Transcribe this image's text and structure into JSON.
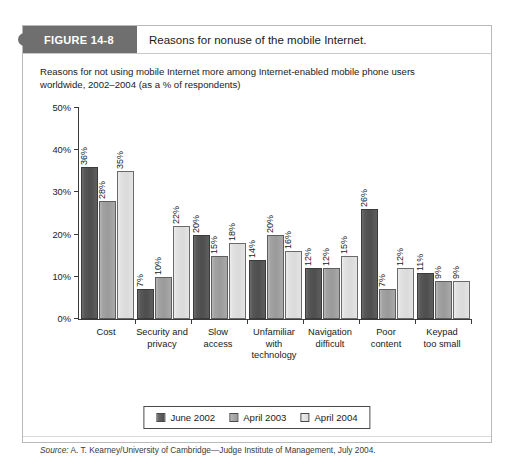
{
  "figure": {
    "tab_label": "FIGURE 14-8",
    "caption": "Reasons for nonuse of the mobile Internet."
  },
  "source": {
    "label": "Source:",
    "text": " A. T. Kearney/University of Cambridge—Judge Institute of Management, July 2004."
  },
  "colors": {
    "series_june_2002": "#4e4e4e",
    "series_april_2003": "#9a9a9a",
    "series_april_2004": "#dadada",
    "tab_background": "#6f6f6f",
    "axis": "#3a3a3a"
  },
  "chart_data": {
    "type": "bar",
    "title": "Reasons for not using mobile Internet more among Internet-enabled mobile phone users worldwide, 2002–2004 (as a % of respondents)",
    "title_line1": "Reasons for not using mobile Internet more among Internet-enabled mobile phone users",
    "title_line2": "worldwide, 2002–2004 (as a % of respondents)",
    "xlabel": "",
    "ylabel": "",
    "ylim": [
      0,
      50
    ],
    "ytick_values": [
      0,
      10,
      20,
      30,
      40,
      50
    ],
    "yticks": [
      "0%",
      "10%",
      "20%",
      "30%",
      "40%",
      "50%"
    ],
    "grid": false,
    "legend_position": "bottom",
    "value_suffix": "%",
    "categories": [
      "Cost",
      "Security and privacy",
      "Slow access",
      "Unfamiliar with technology",
      "Navigation difficult",
      "Poor content",
      "Keypad too small"
    ],
    "category_lines": [
      [
        "Cost"
      ],
      [
        "Security and",
        "privacy"
      ],
      [
        "Slow",
        "access"
      ],
      [
        "Unfamiliar",
        "with",
        "technology"
      ],
      [
        "Navigation",
        "difficult"
      ],
      [
        "Poor",
        "content"
      ],
      [
        "Keypad",
        "too small"
      ]
    ],
    "series": [
      {
        "name": "June 2002",
        "values": [
          36,
          7,
          20,
          14,
          12,
          26,
          11
        ],
        "labels": [
          "36%",
          "7%",
          "20%",
          "14%",
          "12%",
          "26%",
          "11%"
        ]
      },
      {
        "name": "April 2003",
        "values": [
          28,
          10,
          15,
          20,
          12,
          7,
          9
        ],
        "labels": [
          "28%",
          "10%",
          "15%",
          "20%",
          "12%",
          "7%",
          "9%"
        ]
      },
      {
        "name": "April 2004",
        "values": [
          35,
          22,
          18,
          16,
          15,
          12,
          9
        ],
        "labels": [
          "35%",
          "22%",
          "18%",
          "16%",
          "15%",
          "12%",
          "9%"
        ]
      }
    ]
  }
}
